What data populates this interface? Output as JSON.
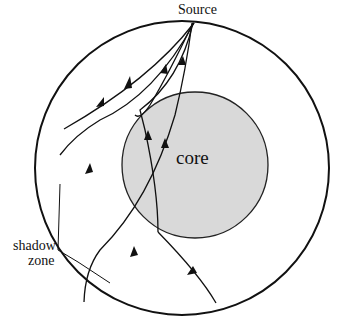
{
  "diagram": {
    "labels": {
      "source": "Source",
      "core": "core",
      "shadow_line1": "shadow",
      "shadow_line2": "zone"
    },
    "colors": {
      "core_fill": "#d9d9d9",
      "stroke": "#111111",
      "background": "#ffffff"
    }
  }
}
